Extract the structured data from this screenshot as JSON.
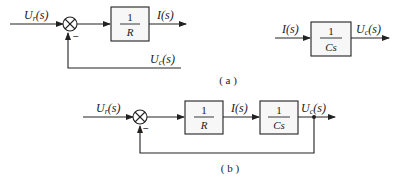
{
  "diagram_a": {
    "caption": "( a )",
    "input_label": {
      "main": "U",
      "sub": "r",
      "arg": "(s)"
    },
    "summing_sign": "−",
    "block_r": {
      "numerator": "1",
      "denominator": "R"
    },
    "output_label": "I(s)",
    "feedback_label": {
      "main": "U",
      "sub": "c",
      "arg": "(s)"
    },
    "block_cs": {
      "input_label": "I(s)",
      "numerator": "1",
      "denominator": "Cs",
      "output_label": {
        "main": "U",
        "sub": "c",
        "arg": "(s)"
      }
    }
  },
  "diagram_b": {
    "caption": "( b )",
    "input_label": {
      "main": "U",
      "sub": "r",
      "arg": "(s)"
    },
    "summing_sign": "−",
    "block_r": {
      "numerator": "1",
      "denominator": "R"
    },
    "intermediate_label": "I(s)",
    "block_cs": {
      "numerator": "1",
      "denominator": "Cs"
    },
    "output_label": {
      "main": "U",
      "sub": "c",
      "arg": "(s)"
    }
  },
  "colors": {
    "line": "#222222",
    "block_fill": "#f7f7f7",
    "background": "#ffffff"
  }
}
